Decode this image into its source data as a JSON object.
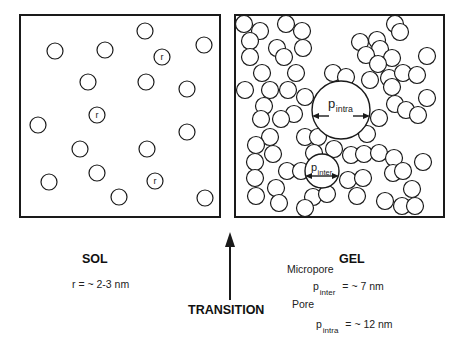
{
  "diagram": {
    "panels": {
      "sol": {
        "label": "SOL",
        "radius_label": "r",
        "annotation": "r =  ~ 2-3 nm",
        "box": {
          "x": 20,
          "y": 15,
          "w": 200,
          "h": 202
        },
        "particles": [
          [
            145,
            31
          ],
          [
            55,
            51
          ],
          [
            105,
            50
          ],
          [
            204,
            45
          ],
          [
            162,
            57
          ],
          [
            88,
            82
          ],
          [
            146,
            82
          ],
          [
            187,
            89
          ],
          [
            97,
            115
          ],
          [
            38,
            125
          ],
          [
            187,
            132
          ],
          [
            80,
            149
          ],
          [
            147,
            149
          ],
          [
            49,
            182
          ],
          [
            97,
            173
          ],
          [
            155,
            181
          ],
          [
            119,
            197
          ],
          [
            205,
            198
          ]
        ],
        "labeled_particles": [
          [
            162,
            57
          ],
          [
            97,
            115
          ],
          [
            155,
            181
          ]
        ],
        "particle_radius": 8
      },
      "gel": {
        "label": "GEL",
        "box": {
          "x": 235,
          "y": 15,
          "w": 209,
          "h": 202
        },
        "pore_intra": {
          "cx": 341,
          "cy": 110,
          "r": 29,
          "label": "p",
          "sub": "intra"
        },
        "pore_inter": {
          "cx": 322,
          "cy": 171,
          "r": 17,
          "label": "p",
          "sub": "inter"
        },
        "micropore_label": "Micropore",
        "micropore_symbol": "p",
        "micropore_sub": "inter",
        "micropore_value": "=  ~  7 nm",
        "pore_label": "Pore",
        "pore_symbol": "p",
        "pore_sub": "intra",
        "pore_value": "=  ~ 12 nm",
        "particle_radius": 8.5,
        "particles": [
          [
            244,
            24
          ],
          [
            286,
            24
          ],
          [
            260,
            31
          ],
          [
            302,
            31
          ],
          [
            395,
            24
          ],
          [
            250,
            41
          ],
          [
            277,
            48
          ],
          [
            303,
            48
          ],
          [
            360,
            42
          ],
          [
            377,
            40
          ],
          [
            400,
            32
          ],
          [
            250,
            57
          ],
          [
            284,
            57
          ],
          [
            380,
            49
          ],
          [
            392,
            58
          ],
          [
            366,
            55
          ],
          [
            262,
            73
          ],
          [
            296,
            73
          ],
          [
            378,
            64
          ],
          [
            427,
            56
          ],
          [
            389,
            78
          ],
          [
            403,
            73
          ],
          [
            417,
            75
          ],
          [
            245,
            90
          ],
          [
            270,
            90
          ],
          [
            288,
            90
          ],
          [
            333,
            73
          ],
          [
            346,
            77
          ],
          [
            370,
            80
          ],
          [
            264,
            106
          ],
          [
            305,
            97
          ],
          [
            392,
            87
          ],
          [
            427,
            98
          ],
          [
            395,
            104
          ],
          [
            406,
            110
          ],
          [
            418,
            115
          ],
          [
            294,
            114
          ],
          [
            261,
            119
          ],
          [
            281,
            119
          ],
          [
            270,
            137
          ],
          [
            305,
            137
          ],
          [
            379,
            118
          ],
          [
            367,
            134
          ],
          [
            256,
            145
          ],
          [
            255,
            162
          ],
          [
            255,
            178
          ],
          [
            256,
            196
          ],
          [
            287,
            171
          ],
          [
            276,
            188
          ],
          [
            279,
            203
          ],
          [
            273,
            154
          ],
          [
            318,
            137
          ],
          [
            334,
            149
          ],
          [
            314,
            153
          ],
          [
            351,
            155
          ],
          [
            364,
            154
          ],
          [
            379,
            153
          ],
          [
            394,
            158
          ],
          [
            301,
            171
          ],
          [
            348,
            180
          ],
          [
            363,
            178
          ],
          [
            393,
            173
          ],
          [
            403,
            171
          ],
          [
            423,
            162
          ],
          [
            412,
            189
          ],
          [
            313,
            197
          ],
          [
            327,
            194
          ],
          [
            357,
            196
          ],
          [
            402,
            206
          ],
          [
            385,
            201
          ],
          [
            415,
            206
          ],
          [
            305,
            208
          ]
        ]
      }
    },
    "transition": {
      "label": "TRANSITION",
      "arrow_direction": "up"
    },
    "colors": {
      "stroke": "#1a1a1a",
      "background": "#ffffff"
    }
  }
}
